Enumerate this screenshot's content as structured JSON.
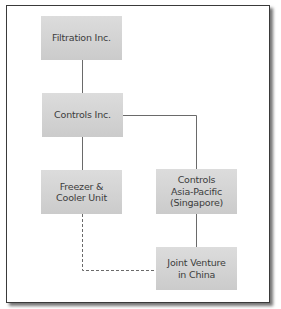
{
  "diagram": {
    "type": "org-chart",
    "nodes": [
      {
        "id": "filtration",
        "label": "Filtration Inc."
      },
      {
        "id": "controls",
        "label": "Controls Inc."
      },
      {
        "id": "freezer",
        "label": "Freezer &\nCooler Unit"
      },
      {
        "id": "asia_pacific",
        "label": "Controls\nAsia-Pacific\n(Singapore)"
      },
      {
        "id": "joint_venture",
        "label": "Joint Venture\nin China"
      }
    ],
    "edges": [
      {
        "from": "filtration",
        "to": "controls",
        "style": "solid"
      },
      {
        "from": "controls",
        "to": "freezer",
        "style": "solid"
      },
      {
        "from": "controls",
        "to": "asia_pacific",
        "style": "solid"
      },
      {
        "from": "asia_pacific",
        "to": "joint_venture",
        "style": "solid"
      },
      {
        "from": "freezer",
        "to": "joint_venture",
        "style": "dashed"
      }
    ],
    "colors": {
      "node_fill": "#d4d4d4",
      "line": "#6a6a6a",
      "text": "#3c3c3c",
      "frame_border": "#3a3a3a"
    }
  }
}
